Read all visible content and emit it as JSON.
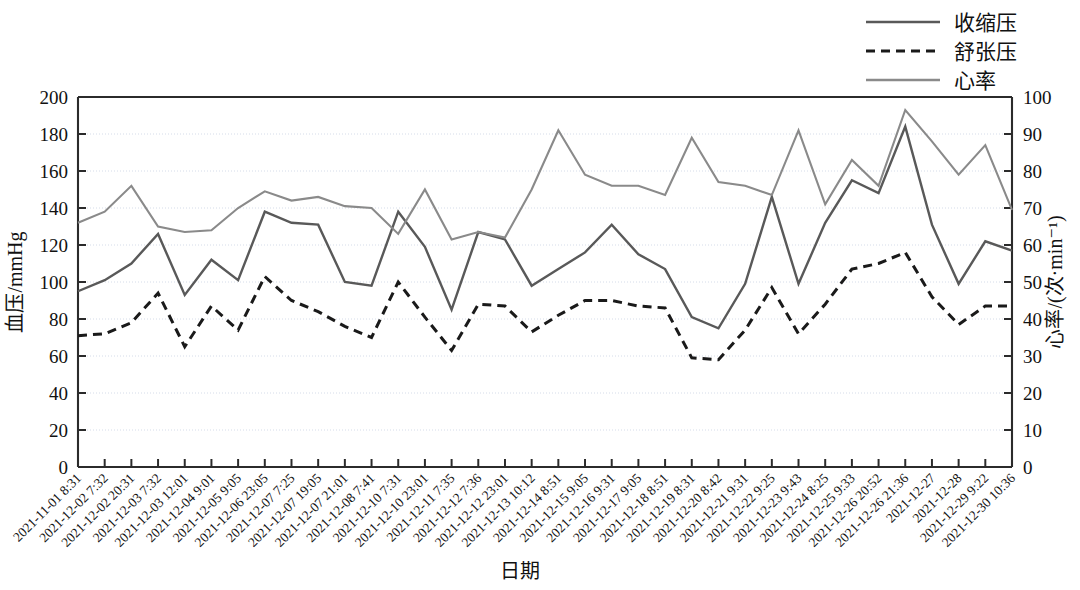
{
  "chart_data": {
    "type": "line",
    "title": "",
    "xlabel": "日期",
    "ylabel": "血压/mmHg",
    "y2label": "心率/(次·min⁻¹)",
    "ylim": [
      0,
      200
    ],
    "y2lim": [
      0,
      100
    ],
    "yticks": [
      0,
      20,
      40,
      60,
      80,
      100,
      120,
      140,
      160,
      180,
      200
    ],
    "y2ticks": [
      0,
      10,
      20,
      30,
      40,
      50,
      60,
      70,
      80,
      90,
      100
    ],
    "grid": true,
    "legend_position": "top-right",
    "categories": [
      "2021-11-01 8:31",
      "2021-12-02 7:32",
      "2021-12-02 20:31",
      "2021-12-03 7:32",
      "2021-12-03 12:01",
      "2021-12-04 9:01",
      "2021-12-05 9:05",
      "2021-12-06 23:05",
      "2021-12-07 7:25",
      "2021-12-07 19:05",
      "2021-12-07 21:01",
      "2021-12-08 7:41",
      "2021-12-10 7:31",
      "2021-12-10 23:01",
      "2021-12-11 7:35",
      "2021-12-12 7:36",
      "2021-12-12 23:01",
      "2021-12-13 10:12",
      "2021-12-14 8:51",
      "2021-12-15 9:05",
      "2021-12-16 9:31",
      "2021-12-17 9:05",
      "2021-12-18 8:51",
      "2021-12-19 8:31",
      "2021-12-20 8:42",
      "2021-12-21 9:31",
      "2021-12-22 9:25",
      "2021-12-23 9:43",
      "2021-12-24 8:25",
      "2021-12-25 9:33",
      "2021-12-26 20:52",
      "2021-12-26 21:36",
      "2021-12-27",
      "2021-12-28",
      "2021-12-29 9:22",
      "2021-12-30 10:36"
    ],
    "series": [
      {
        "name": "收缩压",
        "axis": "left",
        "color": "#595959",
        "style": "solid",
        "values": [
          95,
          101,
          110,
          126,
          93,
          112,
          101,
          138,
          132,
          131,
          100,
          98,
          138,
          119,
          85,
          127,
          123,
          98,
          107,
          116,
          131,
          115,
          107,
          81,
          75,
          99,
          146,
          99,
          132,
          155,
          148,
          184,
          131,
          99,
          122,
          117
        ]
      },
      {
        "name": "舒张压",
        "axis": "left",
        "color": "#1a1a1a",
        "style": "dashed",
        "values": [
          71,
          72,
          78,
          94,
          65,
          87,
          74,
          103,
          90,
          84,
          76,
          70,
          100,
          81,
          63,
          88,
          87,
          73,
          82,
          90,
          90,
          87,
          86,
          59,
          58,
          74,
          97,
          72,
          88,
          107,
          110,
          116,
          92,
          77,
          87,
          87
        ]
      },
      {
        "name": "心率",
        "axis": "right",
        "color": "#8a8a8a",
        "style": "solid",
        "values": [
          66,
          69,
          76,
          65,
          63.5,
          64,
          70,
          74.5,
          72,
          73,
          70.5,
          70,
          63,
          75,
          61.5,
          63.5,
          62,
          75,
          91,
          79,
          76,
          76,
          73.5,
          89,
          77,
          76,
          73.5,
          91,
          71,
          83,
          76,
          96.5,
          88,
          79,
          87,
          69.5
        ]
      }
    ]
  },
  "legend": {
    "items": [
      {
        "label": "收缩压",
        "color": "#595959",
        "style": "solid"
      },
      {
        "label": "舒张压",
        "color": "#1a1a1a",
        "style": "dashed"
      },
      {
        "label": "心率",
        "color": "#8a8a8a",
        "style": "solid"
      }
    ]
  }
}
